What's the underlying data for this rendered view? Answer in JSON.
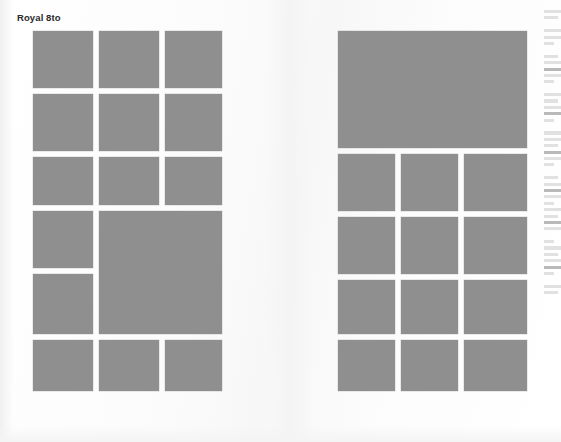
{
  "page": {
    "heading": "Royal 8to",
    "background_color": "#fdfdfd",
    "plate_color": "#8f8f8f",
    "width": 561,
    "height": 442
  },
  "left_page": {
    "name": "left-plate-grid",
    "plates": [
      {
        "label": "plate-1",
        "x": 0,
        "y": 0,
        "w": 60,
        "h": 57
      },
      {
        "label": "plate-2",
        "x": 66,
        "y": 0,
        "w": 60,
        "h": 57
      },
      {
        "label": "plate-3",
        "x": 132,
        "y": 0,
        "w": 57,
        "h": 57
      },
      {
        "label": "plate-4",
        "x": 0,
        "y": 63,
        "w": 60,
        "h": 57
      },
      {
        "label": "plate-5",
        "x": 66,
        "y": 63,
        "w": 60,
        "h": 57
      },
      {
        "label": "plate-6",
        "x": 132,
        "y": 63,
        "w": 57,
        "h": 57
      },
      {
        "label": "plate-7",
        "x": 0,
        "y": 126,
        "w": 60,
        "h": 48
      },
      {
        "label": "plate-8",
        "x": 66,
        "y": 126,
        "w": 60,
        "h": 48
      },
      {
        "label": "plate-9",
        "x": 132,
        "y": 126,
        "w": 57,
        "h": 48
      },
      {
        "label": "plate-10",
        "x": 0,
        "y": 180,
        "w": 60,
        "h": 57
      },
      {
        "label": "plate-11",
        "x": 66,
        "y": 180,
        "w": 123,
        "h": 123
      },
      {
        "label": "plate-12",
        "x": 0,
        "y": 243,
        "w": 60,
        "h": 60
      },
      {
        "label": "plate-13",
        "x": 0,
        "y": 309,
        "w": 60,
        "h": 51
      },
      {
        "label": "plate-14",
        "x": 66,
        "y": 309,
        "w": 60,
        "h": 51
      },
      {
        "label": "plate-15",
        "x": 132,
        "y": 309,
        "w": 57,
        "h": 51
      }
    ]
  },
  "right_page": {
    "name": "right-plate-grid",
    "plates": [
      {
        "label": "plate-16",
        "x": 0,
        "y": 0,
        "w": 189,
        "h": 117
      },
      {
        "label": "plate-17",
        "x": 0,
        "y": 123,
        "w": 57,
        "h": 57
      },
      {
        "label": "plate-18",
        "x": 63,
        "y": 123,
        "w": 57,
        "h": 57
      },
      {
        "label": "plate-19",
        "x": 126,
        "y": 123,
        "w": 63,
        "h": 57
      },
      {
        "label": "plate-20",
        "x": 0,
        "y": 186,
        "w": 57,
        "h": 57
      },
      {
        "label": "plate-21",
        "x": 63,
        "y": 186,
        "w": 57,
        "h": 57
      },
      {
        "label": "plate-22",
        "x": 126,
        "y": 186,
        "w": 63,
        "h": 57
      },
      {
        "label": "plate-23",
        "x": 0,
        "y": 249,
        "w": 57,
        "h": 54
      },
      {
        "label": "plate-24",
        "x": 63,
        "y": 249,
        "w": 57,
        "h": 54
      },
      {
        "label": "plate-25",
        "x": 126,
        "y": 249,
        "w": 63,
        "h": 54
      },
      {
        "label": "plate-26",
        "x": 0,
        "y": 309,
        "w": 57,
        "h": 51
      },
      {
        "label": "plate-27",
        "x": 63,
        "y": 309,
        "w": 57,
        "h": 51
      },
      {
        "label": "plate-28",
        "x": 126,
        "y": 309,
        "w": 63,
        "h": 51
      }
    ]
  },
  "edge_text_column": {
    "name": "cropped-text-column",
    "description": "illegible sliver of an adjacent text column at the right page edge",
    "line_pattern": [
      "full",
      "mid",
      "gap",
      "full",
      "full",
      "short",
      "gap",
      "mid",
      "full",
      "dark",
      "full",
      "short",
      "gap",
      "full",
      "mid",
      "full",
      "dark",
      "short",
      "gap",
      "full",
      "full",
      "mid",
      "dark",
      "full",
      "short",
      "gap",
      "mid",
      "full",
      "dark",
      "full",
      "short",
      "full",
      "mid",
      "dark",
      "full",
      "gap",
      "short",
      "full",
      "mid",
      "full",
      "dark",
      "short",
      "gap",
      "full",
      "mid"
    ]
  }
}
